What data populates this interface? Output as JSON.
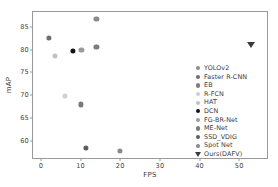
{
  "chart_data": {
    "type": "scatter",
    "title": "",
    "xlabel": "FPS",
    "ylabel": "mAP",
    "xlim": [
      -2,
      57
    ],
    "ylim": [
      56.2,
      88.3
    ],
    "xticks": [
      0,
      10,
      20,
      30,
      40,
      50
    ],
    "yticks": [
      60,
      65,
      70,
      75,
      80,
      85
    ],
    "grid": false,
    "legend_position": "lower right",
    "series": [
      {
        "name": "YOLOv2",
        "marker": "circle",
        "color": "#8c8c8c",
        "x": 14.0,
        "y": 86.7
      },
      {
        "name": "Faster R-CNN",
        "marker": "circle",
        "color": "#6e6e6e",
        "x": 2.0,
        "y": 82.6
      },
      {
        "name": "EB",
        "marker": "circle",
        "color": "#7d7d7d",
        "x": 14.0,
        "y": 80.7
      },
      {
        "name": "R-FCN",
        "marker": "circle",
        "color": "#cfcfcf",
        "x": 6.0,
        "y": 69.9
      },
      {
        "name": "HAT",
        "marker": "circle",
        "color": "#c2c2c2",
        "x": 3.5,
        "y": 78.7
      },
      {
        "name": "DCN",
        "marker": "circle",
        "color": "#141414",
        "x": 8.0,
        "y": 79.8
      },
      {
        "name": "FG-BR-Net",
        "marker": "circle",
        "color": "#9a9a9a",
        "x": 10.2,
        "y": 79.9
      },
      {
        "name": "ME-Net",
        "marker": "circle",
        "color": "#7a7a7a",
        "x": 10.0,
        "y": 68.0
      },
      {
        "name": "SSD_VDIG",
        "marker": "circle",
        "color": "#5e5e5e",
        "x": 11.3,
        "y": 58.4
      },
      {
        "name": "Spot Net",
        "marker": "circle",
        "color": "#8a8a8a",
        "x": 20.0,
        "y": 57.7
      },
      {
        "name": "Ours(DAFV)",
        "marker": "triangle",
        "color": "#3a3a3a",
        "x": 53.0,
        "y": 81.5
      }
    ]
  }
}
